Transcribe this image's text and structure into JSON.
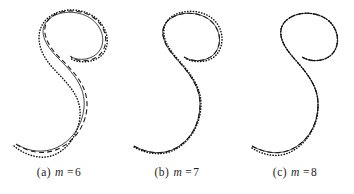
{
  "figure": {
    "background_color": "#ffffff",
    "panel_count": 3
  },
  "panels": [
    {
      "id": "a",
      "caption_label": "(a)",
      "caption_symbol": "m",
      "caption_equals": "=",
      "caption_value": "6",
      "caption_full": "(a) m = 6"
    },
    {
      "id": "b",
      "caption_label": "(b)",
      "caption_symbol": "m",
      "caption_equals": "=",
      "caption_value": "7",
      "caption_full": "(b) m = 7"
    },
    {
      "id": "c",
      "caption_label": "(c)",
      "caption_symbol": "m",
      "caption_equals": "=",
      "caption_value": "8",
      "caption_full": "(c) m = 8"
    }
  ],
  "chart_data": {
    "type": "line",
    "title": "",
    "xlabel": "",
    "ylabel": "",
    "grid": false,
    "legend_position": "none",
    "axis_visible": false,
    "series_styles": [
      {
        "name": "solid",
        "stroke": "#303030",
        "dash": "none"
      },
      {
        "name": "dashed",
        "stroke": "#1a1a1a",
        "dash": "5 3.2"
      },
      {
        "name": "dotted",
        "stroke": "#111111",
        "dash": "0.3 2.5"
      }
    ],
    "panels": [
      {
        "panel": "a",
        "m": 6,
        "series": [
          {
            "name": "solid",
            "path": "M 18 145 C 30 152 44 153 56 148 C 72 141 82 126 84 108 C 86 86 72 72 58 58 C 44 44 38 30 48 20 C 58 10 78 10 90 18 C 102 26 106 40 100 50 C 94 60 78 62 70 56"
          },
          {
            "name": "dashed",
            "path": "M 16 144 C 29 153 45 155 58 149 C 75 141 86 125 87 107 C 88 85 73 71 59 57 C 45 43 40 28 50 18 C 61 8 82 9 94 18 C 106 27 109 42 102 52 C 95 62 79 63 71 57"
          },
          {
            "name": "dotted",
            "path": "M 14 146 C 26 156 42 160 54 155 C 68 149 78 135 80 116 C 82 92 60 78 48 62 C 36 46 36 28 48 18 C 62 6 86 8 98 20 C 109 31 110 46 102 55 C 94 63 78 64 70 58"
          }
        ]
      },
      {
        "panel": "b",
        "m": 7,
        "series": [
          {
            "name": "solid",
            "path": "M 16 146 C 30 154 46 155 58 148 C 74 139 82 122 82 104 C 82 84 68 70 56 56 C 44 42 40 28 52 19 C 64 10 84 12 94 22 C 104 32 104 48 94 56 C 86 62 74 62 66 57"
          },
          {
            "name": "dashed",
            "path": "M 16 146 C 30 154 46 155 58 148 C 74 139 82 122 82 104 C 82 84 68 70 56 56 C 44 42 40 28 52 19 C 64 10 84 12 94 22 C 104 32 104 48 94 56 C 86 62 74 62 66 57"
          },
          {
            "name": "dotted",
            "path": "M 16 147 C 30 155 46 156 58 149 C 74 140 83 122 83 104 C 83 84 69 70 57 56 C 45 42 41 27 53 17 C 66 8 87 10 97 21 C 107 32 106 49 96 57 C 88 63 75 63 67 58"
          }
        ]
      },
      {
        "panel": "c",
        "m": 8,
        "series": [
          {
            "name": "solid",
            "path": "M 16 146 C 30 154 46 155 58 148 C 74 139 82 122 82 104 C 82 84 68 70 56 56 C 44 42 40 28 52 19 C 64 10 84 12 94 22 C 104 32 104 48 94 56 C 86 62 74 62 66 57"
          },
          {
            "name": "dashed",
            "path": "M 16 146 C 30 154 46 155 58 148 C 74 139 82 122 82 104 C 82 84 68 70 56 56 C 44 42 40 28 52 19 C 64 10 84 12 94 22 C 104 32 104 48 94 56 C 86 62 74 62 66 57"
          },
          {
            "name": "dotted",
            "path": "M 16 148 C 30 157 46 158 58 150 C 74 140 83 122 82 104 C 82 84 68 70 56 56 C 44 42 40 28 52 19 C 64 10 84 12 94 22 C 104 32 104 48 94 56 C 86 62 74 62 66 57"
          }
        ]
      }
    ]
  }
}
